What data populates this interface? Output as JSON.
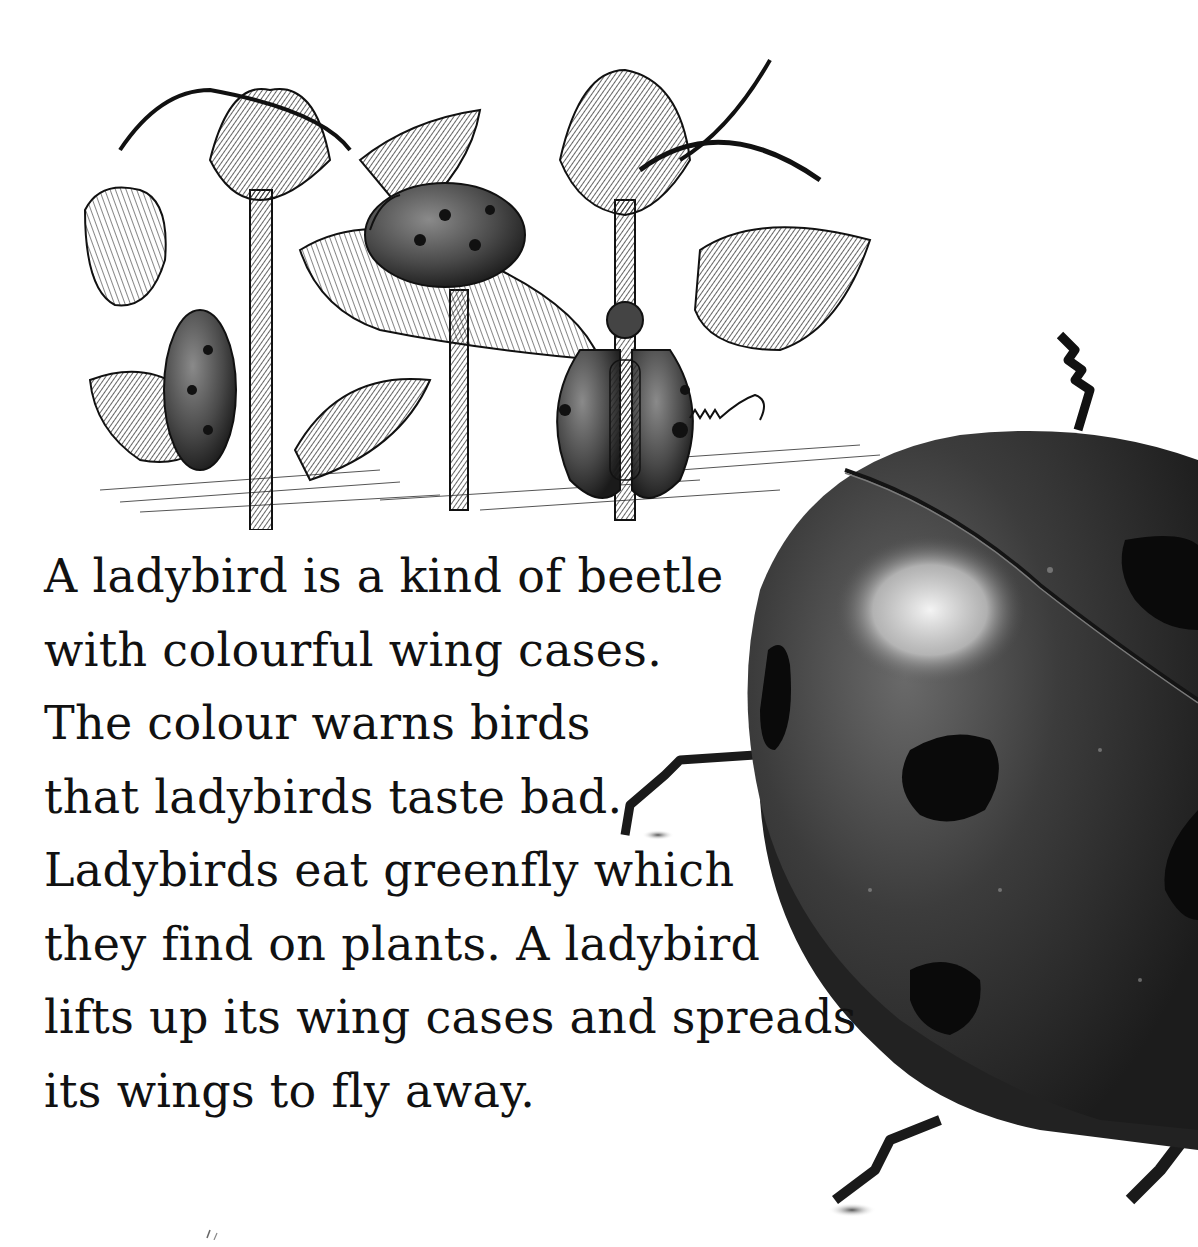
{
  "page": {
    "background": "#ffffff",
    "text_color": "#111111"
  },
  "illustration": {
    "subject": "engraving of ladybirds on rose stems eating greenfly",
    "signature": "IANN"
  },
  "passage": {
    "lines": [
      "A ladybird is a kind of beetle",
      "with colourful wing cases.",
      "The colour warns birds",
      "that ladybirds taste bad.",
      "Ladybirds eat greenfly which",
      "they find on plants. A ladybird",
      "lifts up its wing cases and spreads",
      "its wings to fly away."
    ]
  },
  "photo": {
    "subject": "close-up photograph of a spotted ladybird",
    "shell_color": "#3a3a3a",
    "spot_color": "#0a0a0a"
  }
}
